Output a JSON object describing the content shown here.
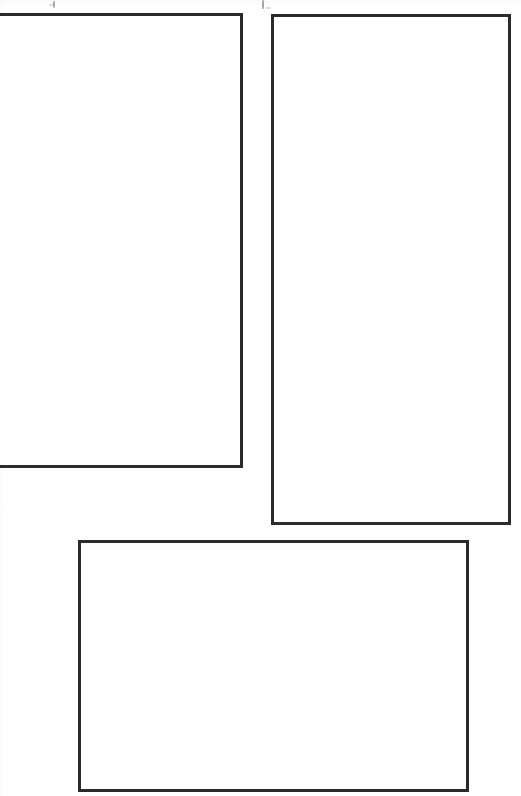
{
  "page": {
    "width": 521,
    "height": 796,
    "background_color": "#ffffff"
  },
  "style": {
    "stroke_color": "#2b2b2b",
    "stroke_width_px": 3,
    "fill_color": "#ffffff"
  },
  "frames": [
    {
      "id": "frame-1",
      "name": "upper-left-frame",
      "label": "",
      "content": "",
      "clipped": "left",
      "x": -14,
      "y": 13,
      "width": 257,
      "height": 455,
      "orientation": "portrait"
    },
    {
      "id": "frame-2",
      "name": "upper-right-frame",
      "label": "",
      "content": "",
      "clipped": "none",
      "x": 271,
      "y": 14,
      "width": 240,
      "height": 511,
      "orientation": "portrait"
    },
    {
      "id": "frame-3",
      "name": "lower-center-frame",
      "label": "",
      "content": "",
      "clipped": "none",
      "x": 78,
      "y": 540,
      "width": 391,
      "height": 252,
      "orientation": "landscape"
    }
  ],
  "specks": [
    {
      "name": "scan-speck-left",
      "x": 53,
      "y": 1,
      "width": 2,
      "height": 7,
      "dark": true
    },
    {
      "name": "scan-speck-left-2",
      "x": 49,
      "y": 4,
      "width": 4,
      "height": 2,
      "dark": false
    },
    {
      "name": "scan-speck-right",
      "x": 262,
      "y": 0,
      "width": 2,
      "height": 9,
      "dark": true
    },
    {
      "name": "scan-speck-right-2",
      "x": 266,
      "y": 7,
      "width": 5,
      "height": 2,
      "dark": false
    }
  ]
}
